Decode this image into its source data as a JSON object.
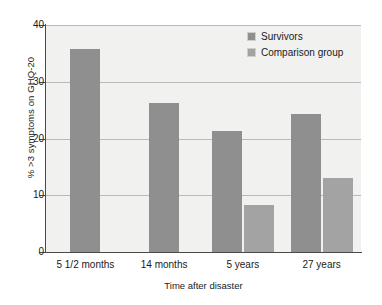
{
  "chart_data": {
    "type": "bar",
    "title": "",
    "xlabel": "Time after disaster",
    "ylabel": "% >3 symptoms on GHQ-20",
    "categories": [
      "5 1/2 months",
      "14 months",
      "5 years",
      "27 years"
    ],
    "series": [
      {
        "name": "Survivors",
        "color": "#8f8f8f",
        "values": [
          35.8,
          26.2,
          21.4,
          24.3
        ]
      },
      {
        "name": "Comparison group",
        "color": "#a3a3a3",
        "values": [
          null,
          null,
          8.2,
          13.0
        ]
      }
    ],
    "ylim": [
      0,
      40
    ],
    "yticks": [
      0,
      10,
      20,
      30,
      40
    ],
    "ytick_labels": [
      "0",
      "10",
      "20",
      "30",
      "40"
    ],
    "grid": true,
    "legend_position": "top-right",
    "plot_background": "#f1f1f0",
    "page_background": "#ffffff",
    "axis_color": "#4a4a4a",
    "grid_color": "#b9b9b9"
  }
}
